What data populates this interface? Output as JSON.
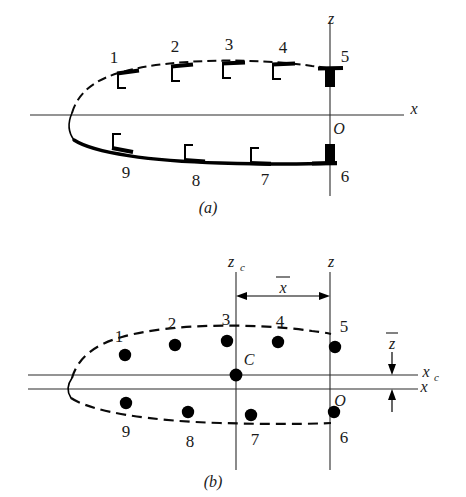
{
  "figure": {
    "background": "#ffffff",
    "ink_color": "#000000"
  },
  "panel_a": {
    "caption": "(a)",
    "axes": {
      "x_label": "x",
      "z_label": "z",
      "origin_label": "O"
    },
    "node_labels": [
      "1",
      "2",
      "3",
      "4",
      "5",
      "6",
      "7",
      "8",
      "9"
    ],
    "upper_surface_style": "dashed",
    "lower_surface_style": "solid-thick",
    "marker_description": "thick tangential bar with inward perpendicular stem"
  },
  "panel_b": {
    "caption": "(b)",
    "axes": {
      "x_label": "x",
      "z_label": "z",
      "xc_label": "x",
      "xc_sub": "c",
      "zc_label": "z",
      "zc_sub": "c",
      "origin_label": "O",
      "centroid_label": "C"
    },
    "dimensions": {
      "horizontal_label": "x",
      "horizontal_overbar": true,
      "vertical_label": "z",
      "vertical_overbar": true
    },
    "node_labels": [
      "1",
      "2",
      "3",
      "4",
      "5",
      "6",
      "7",
      "8",
      "9"
    ],
    "surface_style": "dashed",
    "node_marker": "filled-circle"
  },
  "colors": {
    "ink": "#000000",
    "axis": "#2b2b2b",
    "label": "#1a1a1a",
    "background": "#ffffff"
  }
}
